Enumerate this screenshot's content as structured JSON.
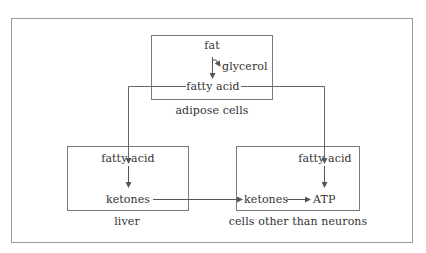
{
  "diagram": {
    "colors": {
      "line": "#8a8a8a",
      "text": "#333333",
      "background": "#ffffff"
    },
    "adipose": {
      "caption": "adipose cells",
      "fat": "fat",
      "glycerol": "glycerol",
      "fatty_acid": "fatty acid"
    },
    "liver": {
      "caption": "liver",
      "fatty_acid": "fatty acid",
      "ketones": "ketones"
    },
    "other_cells": {
      "caption": "cells other than neurons",
      "fatty_acid": "fatty acid",
      "ketones": "ketones",
      "atp": "ATP"
    },
    "edges": [
      {
        "from": "adipose.fat",
        "to": "adipose.fatty_acid"
      },
      {
        "from": "adipose.fat",
        "to": "adipose.glycerol"
      },
      {
        "from": "adipose.fatty_acid",
        "to": "liver.fatty_acid"
      },
      {
        "from": "adipose.fatty_acid",
        "to": "other_cells.fatty_acid"
      },
      {
        "from": "liver.fatty_acid",
        "to": "liver.ketones"
      },
      {
        "from": "liver.ketones",
        "to": "other_cells.ketones"
      },
      {
        "from": "other_cells.ketones",
        "to": "other_cells.atp"
      },
      {
        "from": "other_cells.fatty_acid",
        "to": "other_cells.atp"
      }
    ]
  }
}
